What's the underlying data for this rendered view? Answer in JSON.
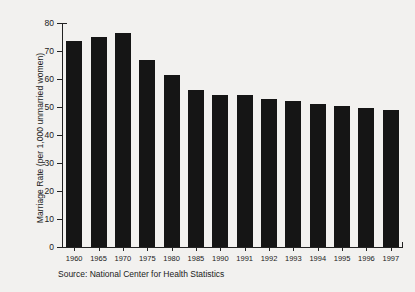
{
  "chart_data": {
    "type": "bar",
    "title": "",
    "subtitle": "",
    "xlabel": "",
    "ylabel": "Marriage Rate (per 1,000 unmarried women)",
    "categories": [
      "1960",
      "1965",
      "1970",
      "1975",
      "1980",
      "1985",
      "1990",
      "1991",
      "1992",
      "1993",
      "1994",
      "1995",
      "1996",
      "1997"
    ],
    "values": [
      73.5,
      75.0,
      76.5,
      66.9,
      61.4,
      56.2,
      54.2,
      54.2,
      53.0,
      52.0,
      51.0,
      50.5,
      49.5,
      49.0
    ],
    "ylim": [
      0,
      80
    ],
    "yticks": [
      0,
      10,
      20,
      30,
      40,
      50,
      60,
      70,
      80
    ],
    "ytick_labels": [
      "0",
      "10",
      "20",
      "30",
      "40",
      "50",
      "60",
      "70",
      "80"
    ],
    "grid": false,
    "legend": "none",
    "bar_color": "#151515",
    "background_color": "#f2f1ef",
    "axis_color": "#222222",
    "annotations": [
      "Source: National Center for Health Statistics"
    ]
  },
  "source": {
    "text": "Source: National Center for Health Statistics"
  }
}
